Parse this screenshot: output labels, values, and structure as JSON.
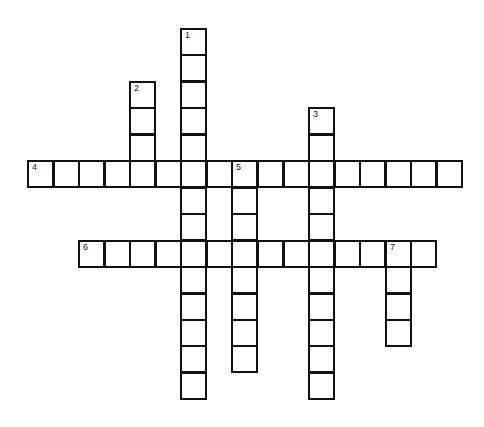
{
  "puzzle": {
    "type": "crossword",
    "origin_x": 27,
    "origin_y": 28,
    "pitch_x": 25.55,
    "pitch_y": 26.45,
    "cell_w": 27,
    "cell_h": 28,
    "entries": [
      {
        "number": "1",
        "direction": "down",
        "col": 6,
        "row": 0,
        "length": 14
      },
      {
        "number": "2",
        "direction": "down",
        "col": 4,
        "row": 2,
        "length": 4
      },
      {
        "number": "3",
        "direction": "down",
        "col": 11,
        "row": 3,
        "length": 11
      },
      {
        "number": "4",
        "direction": "across",
        "col": 0,
        "row": 5,
        "length": 17
      },
      {
        "number": "5",
        "direction": "down",
        "col": 8,
        "row": 5,
        "length": 8
      },
      {
        "number": "6",
        "direction": "across",
        "col": 2,
        "row": 8,
        "length": 14
      },
      {
        "number": "7",
        "direction": "down",
        "col": 14,
        "row": 8,
        "length": 4
      }
    ]
  }
}
